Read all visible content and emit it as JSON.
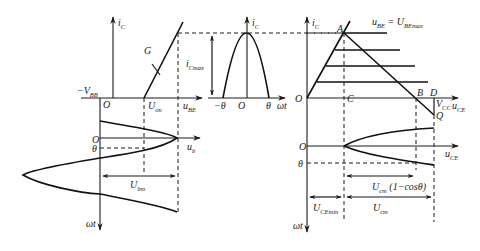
{
  "figure": {
    "panels": {
      "transfer": {
        "y_axis": {
          "main": "i",
          "sub": "C"
        },
        "x_axis": {
          "main": "u",
          "sub": "BE"
        },
        "origin": "O",
        "neg_bias": {
          "prefix": "−V",
          "sub": "BB"
        },
        "turn_on": {
          "main": "U",
          "sub": "on"
        },
        "curve_label": "G"
      },
      "pulse": {
        "y_axis": {
          "main": "i",
          "sub": "C"
        },
        "x_axis": "ωt",
        "origin": "O",
        "left_tick": "−θ",
        "right_tick": "θ",
        "amplitude": {
          "main": "i",
          "sub": "Cmax"
        }
      },
      "output": {
        "y_axis": {
          "main": "i",
          "sub": "C"
        },
        "x_axis": {
          "main": "u",
          "sub": "CE"
        },
        "origin": "O",
        "points": {
          "A": "A",
          "B": "B",
          "C": "C",
          "D": "D",
          "Q": "Q"
        },
        "vcc": {
          "main": "V",
          "sub": "CC"
        },
        "top_curve": {
          "lhs_main": "u",
          "lhs_sub": "BE",
          "eq": " = ",
          "rhs_main": "U",
          "rhs_sub": "BEmax"
        }
      },
      "input_wave": {
        "x_axis": {
          "main": "u",
          "sub": "b"
        },
        "y_axis": "ωt",
        "origin": "O",
        "theta": "θ",
        "amplitude": {
          "main": "U",
          "sub": "bm"
        }
      },
      "output_wave": {
        "x_axis": {
          "main": "u",
          "sub": "CE"
        },
        "y_axis": "ωt",
        "origin": "O",
        "theta": "θ",
        "span1": {
          "main": "U",
          "sub": "cm",
          "tail": " (1−cosθ)"
        },
        "span2": {
          "main": "U",
          "sub": "CEmin"
        },
        "span3": {
          "main": "U",
          "sub": "cm"
        }
      }
    }
  }
}
